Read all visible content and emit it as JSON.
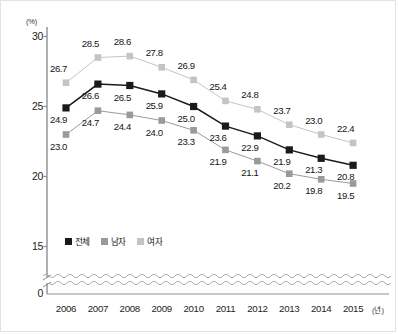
{
  "axes": {
    "y_unit": "(%)",
    "x_unit": "(년)",
    "y_ticks": [
      "30",
      "25",
      "20",
      "15",
      "0"
    ],
    "x_ticks": [
      "2006",
      "2007",
      "2008",
      "2009",
      "2010",
      "2011",
      "2012",
      "2013",
      "2014",
      "2015"
    ]
  },
  "legend": {
    "items": [
      {
        "label": "전체",
        "color": "#1a1a1a"
      },
      {
        "label": "남자",
        "color": "#9a9a9a"
      },
      {
        "label": "여자",
        "color": "#c4c4c4"
      }
    ]
  },
  "labels": {
    "total": [
      "24.9",
      "26.6",
      "26.5",
      "25.9",
      "25.0",
      "23.6",
      "22.9",
      "21.9",
      "21.3",
      "20.8"
    ],
    "male": [
      "23.0",
      "24.7",
      "24.4",
      "24.0",
      "23.3",
      "21.9",
      "21.1",
      "20.2",
      "19.8",
      "19.5"
    ],
    "female": [
      "26.7",
      "28.5",
      "28.6",
      "27.8",
      "26.9",
      "25.4",
      "24.8",
      "23.7",
      "23.0",
      "22.4"
    ]
  },
  "chart_data": {
    "type": "line",
    "title": "",
    "xlabel": "(년)",
    "ylabel": "(%)",
    "categories": [
      "2006",
      "2007",
      "2008",
      "2009",
      "2010",
      "2011",
      "2012",
      "2013",
      "2014",
      "2015"
    ],
    "series": [
      {
        "name": "전체",
        "color": "#1a1a1a",
        "values": [
          24.9,
          26.6,
          26.5,
          25.9,
          25.0,
          23.6,
          22.9,
          21.9,
          21.3,
          20.8
        ]
      },
      {
        "name": "남자",
        "color": "#9a9a9a",
        "values": [
          23.0,
          24.7,
          24.4,
          24.0,
          23.3,
          21.9,
          21.1,
          20.2,
          19.8,
          19.5
        ]
      },
      {
        "name": "여자",
        "color": "#c4c4c4",
        "values": [
          26.7,
          28.5,
          28.6,
          27.8,
          26.9,
          25.4,
          24.8,
          23.7,
          23.0,
          22.4
        ]
      }
    ],
    "ylim": [
      15,
      30
    ],
    "ytick_values": [
      30,
      25,
      20,
      15,
      0
    ],
    "axis_break": true,
    "grid": false,
    "legend_position": "inside-bottom-left",
    "marker": "square",
    "data_labels": true
  }
}
